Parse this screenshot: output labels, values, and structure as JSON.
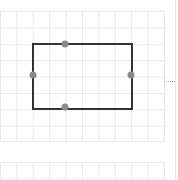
{
  "canvas": {
    "background": "#ffffff",
    "grid_color": "#e8e8e8",
    "grid_spacing_px": 16
  },
  "selected_shape": {
    "type": "rectangle",
    "stroke_color": "#333333",
    "handle_color": "#8a8a8a",
    "handles": [
      {
        "name": "top",
        "x": 65,
        "y": 43
      },
      {
        "name": "left",
        "x": 32,
        "y": 75
      },
      {
        "name": "right",
        "x": 131,
        "y": 75
      },
      {
        "name": "bottom",
        "x": 65,
        "y": 108
      }
    ]
  },
  "panel": {
    "divider_color": "#e4e4e4"
  }
}
